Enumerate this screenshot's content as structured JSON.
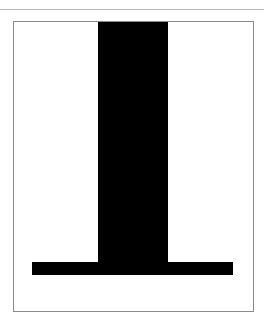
{
  "figure": {
    "colors": {
      "background": "#ffffff",
      "frame": "#8a8a8a",
      "top_rule": "#b8b8b8",
      "shape": "#000000"
    },
    "shapes": [
      {
        "name": "vertical-stem",
        "x": 98,
        "y": 21,
        "width": 70,
        "height": 241
      },
      {
        "name": "horizontal-base",
        "x": 32,
        "y": 262,
        "width": 201,
        "height": 13
      }
    ]
  }
}
